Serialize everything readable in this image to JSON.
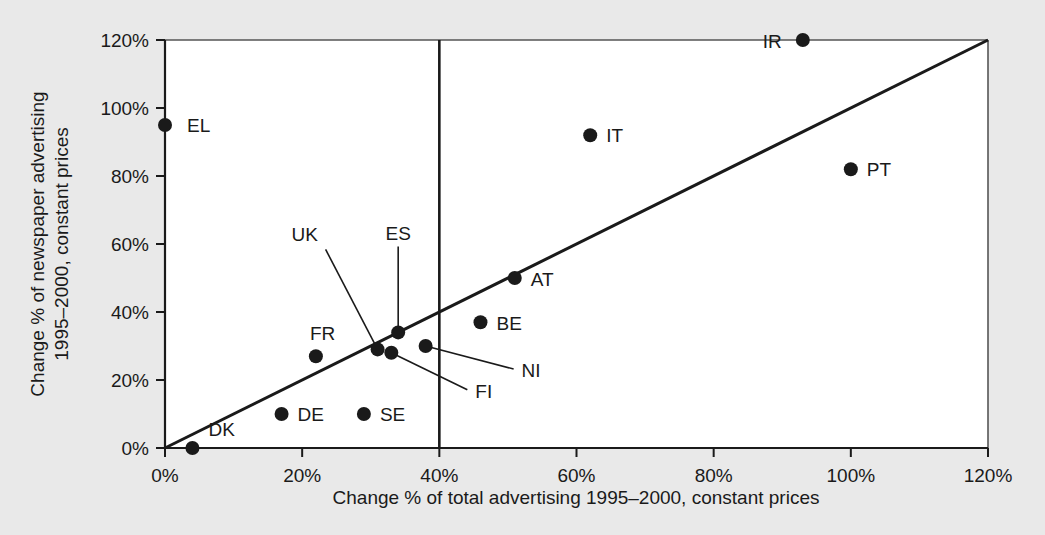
{
  "chart_data": {
    "type": "scatter",
    "title": "",
    "xlabel": "Change % of total advertising 1995–2000, constant prices",
    "ylabel_line1": "Change % of newspaper advertising",
    "ylabel_line2": "1995–2000, constant prices",
    "xlim": [
      0,
      120
    ],
    "ylim": [
      0,
      120
    ],
    "xticks": [
      0,
      20,
      40,
      60,
      80,
      100,
      120
    ],
    "yticks": [
      0,
      20,
      40,
      60,
      80,
      100,
      120
    ],
    "xtick_labels": [
      "0%",
      "20%",
      "40%",
      "60%",
      "80%",
      "100%",
      "120%"
    ],
    "ytick_labels": [
      "0%",
      "20%",
      "40%",
      "60%",
      "80%",
      "100%",
      "120%"
    ],
    "grid": false,
    "legend": "none",
    "points": [
      {
        "label": "EL",
        "x": 0,
        "y": 95,
        "label_dx": 22,
        "label_dy": 7,
        "leader": false
      },
      {
        "label": "IR",
        "x": 93,
        "y": 120,
        "label_dx": -40,
        "label_dy": 8,
        "leader": false
      },
      {
        "label": "IT",
        "x": 62,
        "y": 92,
        "label_dx": 16,
        "label_dy": 7,
        "leader": false
      },
      {
        "label": "PT",
        "x": 100,
        "y": 82,
        "label_dx": 16,
        "label_dy": 7,
        "leader": false
      },
      {
        "label": "AT",
        "x": 51,
        "y": 50,
        "label_dx": 16,
        "label_dy": 8,
        "leader": false
      },
      {
        "label": "BE",
        "x": 46,
        "y": 37,
        "label_dx": 16,
        "label_dy": 8,
        "leader": false
      },
      {
        "label": "FR",
        "x": 22,
        "y": 27,
        "label_dx": -6,
        "label_dy": -16,
        "leader": false
      },
      {
        "label": "DE",
        "x": 17,
        "y": 10,
        "label_dx": 16,
        "label_dy": 7,
        "leader": false
      },
      {
        "label": "SE",
        "x": 29,
        "y": 10,
        "label_dx": 16,
        "label_dy": 7,
        "leader": false
      },
      {
        "label": "DK",
        "x": 4,
        "y": 0,
        "label_dx": 16,
        "label_dy": -12,
        "leader": false
      },
      {
        "label": "ES",
        "x": 34,
        "y": 34,
        "label_dx": 0,
        "label_dy": -92,
        "leader": true
      },
      {
        "label": "UK",
        "x": 31,
        "y": 29,
        "label_dx": -86,
        "label_dy": -108,
        "leader": true
      },
      {
        "label": "FI",
        "x": 33,
        "y": 28,
        "label_dx": 84,
        "label_dy": 45,
        "leader": true
      },
      {
        "label": "NI",
        "x": 38,
        "y": 30,
        "label_dx": 96,
        "label_dy": 31,
        "leader": true
      }
    ],
    "reference_lines": [
      {
        "name": "identity-line",
        "type": "diagonal",
        "from": [
          0,
          0
        ],
        "to": [
          120,
          120
        ]
      },
      {
        "name": "vertical-marker",
        "type": "vertical",
        "x": 40,
        "from_y": 0,
        "to_y": 120
      }
    ],
    "colors": {
      "point": "#1a1a1a",
      "axis": "#1a1a1a",
      "plot_background": "#ffffff",
      "figure_background": "#e9e9e9"
    }
  }
}
